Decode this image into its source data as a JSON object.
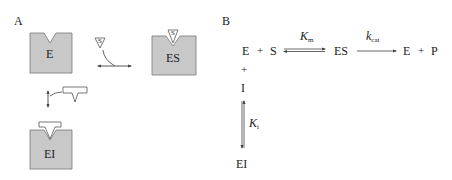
{
  "panel_a": {
    "label": "A",
    "enzyme_label": "E",
    "substrate_label": "S",
    "complex_es_label": "ES",
    "complex_ei_label": "EI"
  },
  "panel_b": {
    "label": "B",
    "row1": {
      "e": "E",
      "plus1": "+",
      "s": "S",
      "km_symbol": "K",
      "km_sub": "m",
      "es": "ES",
      "kcat_symbol": "k",
      "kcat_sub": "cat",
      "e2": "E",
      "plus2": "+",
      "p": "P"
    },
    "plus_vertical": "+",
    "inhibitor": "I",
    "ki_symbol": "K",
    "ki_sub": "i",
    "ei": "EI"
  },
  "colors": {
    "block_fill": "#c8c8c8",
    "block_stroke": "#666666",
    "text": "#222222"
  }
}
